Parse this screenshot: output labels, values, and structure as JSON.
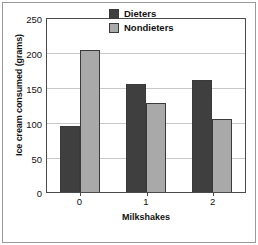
{
  "chart_data": {
    "type": "bar",
    "title": "",
    "subtitle": "",
    "categories": [
      "0",
      "1",
      "2"
    ],
    "series": [
      {
        "name": "Dieters",
        "values": [
          96,
          156,
          162
        ],
        "color": "#3f3f3f"
      },
      {
        "name": "Nondieters",
        "values": [
          205,
          128,
          105
        ],
        "color": "#a9a9a9"
      }
    ],
    "xlabel": "Milkshakes",
    "ylabel": "Ice cream consumed (grams)",
    "ylim": [
      0,
      250
    ],
    "yticks": [
      0,
      50,
      100,
      150,
      200,
      250
    ],
    "ytick_labels": [
      "0",
      "50",
      "100",
      "150",
      "200",
      "250"
    ],
    "xtick_labels": [
      "0",
      "1",
      "2"
    ],
    "grid": true,
    "grid_axis": "y",
    "legend": true,
    "legend_position": "top-right",
    "legend_entries": [
      "Dieters",
      "Nondieters"
    ],
    "annotations": []
  }
}
